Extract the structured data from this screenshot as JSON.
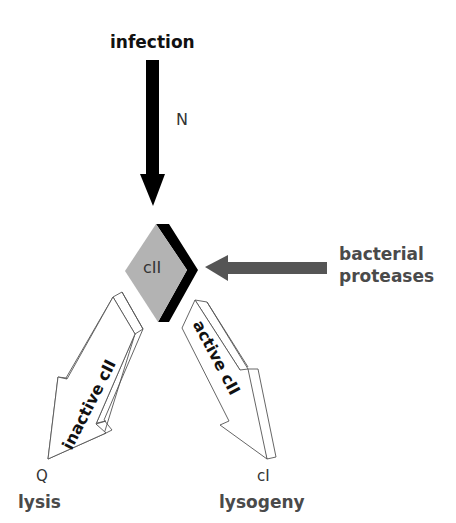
{
  "diagram": {
    "title": "infection",
    "labels": {
      "n_gene": "N",
      "protein": "cII",
      "proteases": [
        "bacterial",
        "proteases"
      ],
      "inactive_arrow": "inactive cII",
      "active_arrow": "active cII",
      "q_gene": "Q",
      "ci_gene": "cI",
      "lysis": "lysis",
      "lysogeny": "lysogeny"
    },
    "colors": {
      "black_arrow": "#000000",
      "gray_arrow": "#555555",
      "diamond_fill": "#b3b3b3",
      "diamond_band": "#000000",
      "text_dark": "#4a4a4a",
      "outline_arrow": "#555555"
    },
    "nodes": [
      {
        "id": "infection",
        "label": "infection"
      },
      {
        "id": "cII",
        "label": "cII"
      },
      {
        "id": "proteases",
        "label": "bacterial proteases"
      },
      {
        "id": "lysis",
        "label": "lysis",
        "gene": "Q"
      },
      {
        "id": "lysogeny",
        "label": "lysogeny",
        "gene": "cI"
      }
    ],
    "edges": [
      {
        "from": "infection",
        "to": "cII",
        "label": "N"
      },
      {
        "from": "proteases",
        "to": "cII",
        "label": ""
      },
      {
        "from": "cII",
        "to": "lysis",
        "label": "inactive cII"
      },
      {
        "from": "cII",
        "to": "lysogeny",
        "label": "active cII"
      }
    ]
  }
}
